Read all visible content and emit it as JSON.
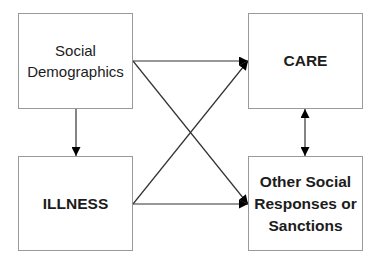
{
  "diagram": {
    "type": "flow",
    "nodes": [
      {
        "id": "social-demographics",
        "label": "Social\nDemographics",
        "bold": false,
        "x": 18,
        "y": 13,
        "w": 115,
        "h": 96
      },
      {
        "id": "care",
        "label": "CARE",
        "bold": true,
        "x": 248,
        "y": 13,
        "w": 115,
        "h": 96
      },
      {
        "id": "illness",
        "label": "ILLNESS",
        "bold": true,
        "x": 18,
        "y": 156,
        "w": 115,
        "h": 95
      },
      {
        "id": "other-social-responses",
        "label": "Other Social\nResponses or\nSanctions",
        "bold": true,
        "x": 248,
        "y": 156,
        "w": 115,
        "h": 95
      }
    ],
    "edges": [
      {
        "from": "social-demographics",
        "to": "care",
        "x1": 133,
        "y1": 61,
        "x2": 248,
        "y2": 61,
        "heads": "end"
      },
      {
        "from": "social-demographics",
        "to": "other-social-responses",
        "x1": 133,
        "y1": 61,
        "x2": 248,
        "y2": 204,
        "heads": "end"
      },
      {
        "from": "social-demographics",
        "to": "illness",
        "x1": 76,
        "y1": 109,
        "x2": 76,
        "y2": 156,
        "heads": "end"
      },
      {
        "from": "illness",
        "to": "care",
        "x1": 133,
        "y1": 204,
        "x2": 248,
        "y2": 61,
        "heads": "end"
      },
      {
        "from": "illness",
        "to": "other-social-responses",
        "x1": 133,
        "y1": 204,
        "x2": 248,
        "y2": 204,
        "heads": "end"
      },
      {
        "from": "care",
        "to": "other-social-responses",
        "x1": 305,
        "y1": 109,
        "x2": 305,
        "y2": 156,
        "heads": "both"
      }
    ],
    "colors": {
      "node_border": "#9a9a9a",
      "edge": "#333333",
      "arrowhead": "#000000",
      "text": "#1c1c1c",
      "background": "#ffffff"
    }
  }
}
